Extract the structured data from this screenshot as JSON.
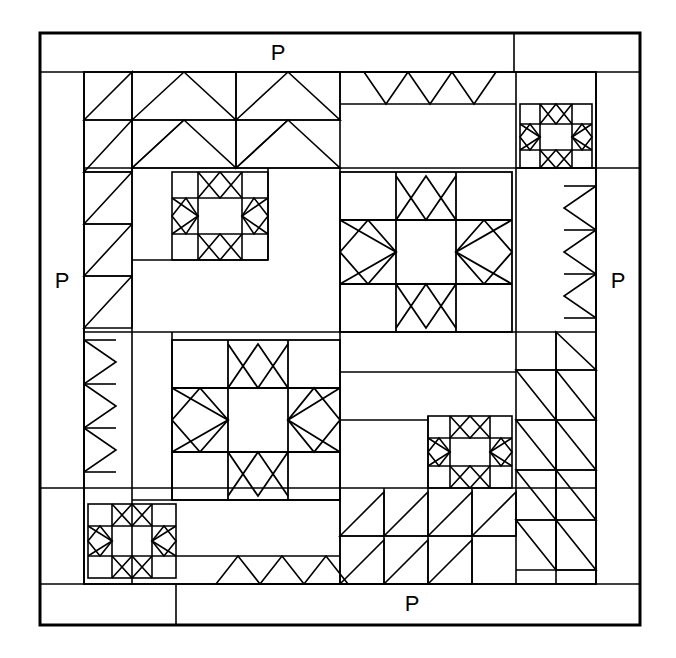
{
  "diagram": {
    "type": "quilt-block-schematic",
    "background_color": "#ffffff",
    "line_color": "#000000",
    "canvas": {
      "width": 676,
      "height": 658
    }
  },
  "border_labels": {
    "top": "P",
    "left": "P",
    "right": "P",
    "bottom": "P"
  },
  "geometry": {
    "outer": {
      "x": 40,
      "y": 33,
      "w": 600,
      "h": 592,
      "stroke": 3
    },
    "inner": {
      "x": 84,
      "y": 72,
      "w": 512,
      "h": 512,
      "stroke": 2
    },
    "border_strip_width": 44,
    "unit": 32
  },
  "blocks": [
    {
      "name": "star-large-upper-right",
      "x": 340,
      "y": 168,
      "size": 160,
      "points": 8
    },
    {
      "name": "star-large-lower-left",
      "x": 180,
      "y": 340,
      "size": 160,
      "points": 8
    },
    {
      "name": "star-small-upper-left",
      "x": 180,
      "y": 168,
      "size": 84,
      "points": 8
    },
    {
      "name": "star-small-upper-right",
      "x": 516,
      "y": 84,
      "size": 84,
      "points": 8
    },
    {
      "name": "star-small-lower-left",
      "x": 96,
      "y": 504,
      "size": 84,
      "points": 8
    },
    {
      "name": "star-small-lower-right",
      "x": 428,
      "y": 420,
      "size": 84,
      "points": 8
    }
  ],
  "sashing": [
    {
      "name": "flying-geese-top-left",
      "orientation": "horizontal",
      "direction": "right",
      "count": 4
    },
    {
      "name": "sawtooth-top-center",
      "orientation": "horizontal",
      "direction": "down",
      "count": 4
    },
    {
      "name": "sawtooth-left-upper",
      "orientation": "vertical",
      "direction": "down",
      "count": 5
    },
    {
      "name": "sawtooth-left-lower",
      "orientation": "vertical",
      "direction": "right",
      "count": 4
    },
    {
      "name": "sawtooth-right-upper",
      "orientation": "vertical",
      "direction": "left",
      "count": 4
    },
    {
      "name": "flying-geese-right-lower",
      "orientation": "vertical",
      "direction": "down",
      "count": 5
    },
    {
      "name": "sawtooth-bottom-left",
      "orientation": "horizontal",
      "direction": "up",
      "count": 4
    },
    {
      "name": "flying-geese-bottom-center",
      "orientation": "horizontal",
      "direction": "right",
      "count": 4
    }
  ],
  "plain_patches": [
    {
      "name": "plain-rect-center-left",
      "x": 148,
      "y": 276,
      "w": 192,
      "h": 96
    },
    {
      "name": "plain-rect-center-right",
      "x": 340,
      "y": 372,
      "w": 192,
      "h": 96
    },
    {
      "name": "plain-rect-top-right",
      "x": 340,
      "y": 104,
      "w": 176,
      "h": 64
    }
  ]
}
